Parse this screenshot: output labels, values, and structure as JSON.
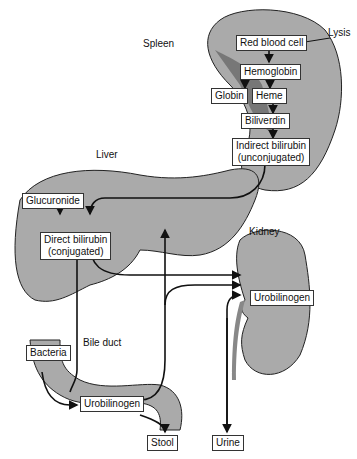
{
  "organs": {
    "spleen": "Spleen",
    "liver": "Liver",
    "kidney": "Kidney",
    "bile_duct": "Bile duct",
    "lysis": "Lysis"
  },
  "boxes": {
    "red_blood_cell": "Red blood cell",
    "hemoglobin": "Hemoglobin",
    "globin": "Globin",
    "heme": "Heme",
    "biliverdin": "Biliverdin",
    "indirect_1": "Indirect bilirubin",
    "indirect_2": "(unconjugated)",
    "glucuronide": "Glucuronide",
    "direct_1": "Direct bilirubin",
    "direct_2": "(conjugated)",
    "urobilinogen_kidney": "Urobilinogen",
    "bacteria": "Bacteria",
    "urobilinogen_gut": "Urobilinogen",
    "stool": "Stool",
    "urine": "Urine"
  },
  "colors": {
    "organ_fill": "#a9a9a9",
    "organ_dark": "#6e6e6e",
    "outline": "#222222"
  }
}
